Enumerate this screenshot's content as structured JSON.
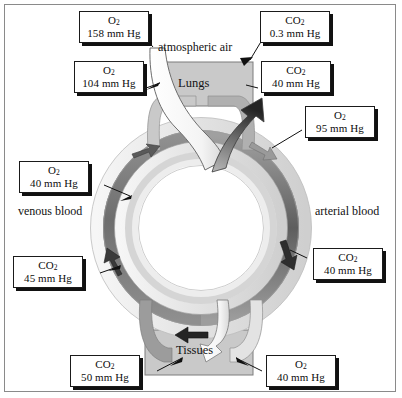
{
  "figure": {
    "type": "physiology-flow-diagram"
  },
  "organs": {
    "lungs": "Lungs",
    "tissues": "Tissues"
  },
  "plain_labels": {
    "atmospheric_air": "atmospheric air",
    "venous_blood": "venous blood",
    "arterial_blood": "arterial blood"
  },
  "callouts": [
    {
      "id": "o2-atmospheric",
      "gas": "O",
      "sub": "2",
      "value": "158 mm Hg"
    },
    {
      "id": "co2-expired",
      "gas": "CO",
      "sub": "2",
      "value": "0.3 mm Hg"
    },
    {
      "id": "o2-alveolar",
      "gas": "O",
      "sub": "2",
      "value": "104 mm Hg"
    },
    {
      "id": "co2-alveolar",
      "gas": "CO",
      "sub": "2",
      "value": "40 mm Hg"
    },
    {
      "id": "o2-arterial",
      "gas": "O",
      "sub": "2",
      "value": "95 mm Hg"
    },
    {
      "id": "o2-venous",
      "gas": "O",
      "sub": "2",
      "value": "40 mm Hg"
    },
    {
      "id": "co2-venous",
      "gas": "CO",
      "sub": "2",
      "value": "45 mm Hg"
    },
    {
      "id": "co2-arterial",
      "gas": "CO",
      "sub": "2",
      "value": "40 mm Hg"
    },
    {
      "id": "co2-tissue",
      "gas": "CO",
      "sub": "2",
      "value": "50 mm Hg"
    },
    {
      "id": "o2-tissue",
      "gas": "O",
      "sub": "2",
      "value": "40 mm Hg"
    }
  ],
  "colors": {
    "frame_border": "#8a8a8a",
    "label_border": "#1a1a1a",
    "label_shadow": "#111111",
    "organ_box_fill": "#c9c9c9",
    "organ_box_border": "#7d7d7d",
    "vessel_light": "#efefef",
    "vessel_mid": "#b4b4b4",
    "vessel_dark": "#6b6b6b",
    "arrow_dark": "#2b2b2b",
    "arrow_mid": "#8c8c8c",
    "white_duct": "#ffffff"
  }
}
